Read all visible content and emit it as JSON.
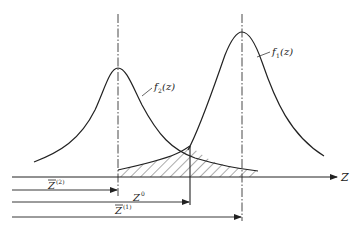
{
  "diagram": {
    "axis": {
      "label": "Z"
    },
    "curves": [
      {
        "id": "f2",
        "label_func": "f",
        "label_sub": "2",
        "label_arg": "(z)",
        "peak_x": 118,
        "peak_y": 68
      },
      {
        "id": "f1",
        "label_func": "f",
        "label_sub": "1",
        "label_arg": "(z)",
        "peak_x": 242,
        "peak_y": 32
      }
    ],
    "markers": [
      {
        "id": "mean2",
        "base": "Z",
        "bar": true,
        "sup": "(2)",
        "x": 118
      },
      {
        "id": "z0",
        "base": "Z",
        "bar": false,
        "sup": "0",
        "x": 190
      },
      {
        "id": "mean1",
        "base": "Z",
        "bar": true,
        "sup": "(1)",
        "x": 242
      }
    ],
    "shaded_region": "overlap (interference) area between f2 tail and f1 tail, hatched",
    "colors": {
      "line": "#222222",
      "hatch": "#444444",
      "background": "#ffffff"
    }
  }
}
